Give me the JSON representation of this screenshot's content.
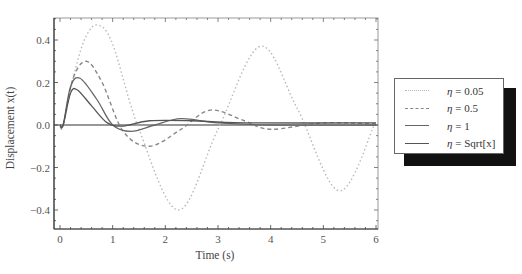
{
  "chart_data": {
    "type": "line",
    "title": "",
    "xlabel": "Time (s)",
    "ylabel": "Displacement x(t)",
    "xlim": [
      -0.1,
      6.05
    ],
    "ylim": [
      -0.5,
      0.52
    ],
    "xticks": [
      "0",
      "1",
      "2",
      "3",
      "4",
      "5",
      "6"
    ],
    "yticks": [
      "-0.4",
      "-0.2",
      "0.0",
      "0.2",
      "0.4"
    ],
    "grid": false,
    "legend_position": "right-outside",
    "series": [
      {
        "name": "η = 0.05",
        "style": "dotted",
        "color": "#b8b8b8",
        "x": [
          0,
          0.06,
          0.3,
          0.5,
          0.72,
          1.0,
          1.5,
          2.25,
          3.0,
          3.8,
          4.5,
          5.3,
          6.0
        ],
        "y": [
          0,
          0.0,
          0.27,
          0.42,
          0.47,
          0.38,
          -0.02,
          -0.4,
          -0.02,
          0.37,
          0.08,
          -0.31,
          0.02
        ]
      },
      {
        "name": "η = 0.5",
        "style": "dashed",
        "color": "#888888",
        "x": [
          0,
          0.06,
          0.25,
          0.5,
          0.8,
          1.2,
          1.7,
          2.3,
          2.85,
          3.5,
          4.0,
          5.0,
          6.0
        ],
        "y": [
          0,
          0.0,
          0.22,
          0.3,
          0.2,
          -0.03,
          -0.1,
          -0.02,
          0.07,
          0.02,
          -0.02,
          0.01,
          0.005
        ]
      },
      {
        "name": "η = 1",
        "style": "solid",
        "color": "#666666",
        "x": [
          0,
          0.06,
          0.2,
          0.38,
          0.7,
          1.0,
          1.35,
          1.8,
          2.3,
          3.0,
          4.0,
          6.0
        ],
        "y": [
          0,
          0.0,
          0.18,
          0.22,
          0.12,
          0.0,
          -0.03,
          0.0,
          0.03,
          0.01,
          0.0,
          0.0
        ]
      },
      {
        "name": "η = Sqrt[x]",
        "style": "solid",
        "color": "#555555",
        "x": [
          0,
          0.06,
          0.2,
          0.33,
          0.6,
          0.9,
          1.2,
          1.7,
          2.5,
          3.5,
          6.0
        ],
        "y": [
          0,
          0.0,
          0.15,
          0.165,
          0.09,
          0.01,
          -0.005,
          0.02,
          0.02,
          0.01,
          0.01
        ]
      }
    ]
  },
  "legend": {
    "items": [
      {
        "eta": "η",
        "label": " = 0.05"
      },
      {
        "eta": "η",
        "label": " = 0.5"
      },
      {
        "eta": "η",
        "label": " = 1"
      },
      {
        "eta": "η",
        "label": " = Sqrt[x]"
      }
    ]
  }
}
